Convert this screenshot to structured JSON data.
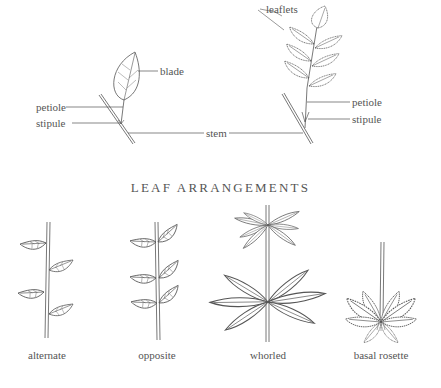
{
  "anatomy": {
    "simple_leaf": {
      "labels": {
        "blade": "blade",
        "petiole": "petiole",
        "stipule": "stipule"
      }
    },
    "compound_leaf": {
      "labels": {
        "leaflets": "leaflets",
        "petiole": "petiole",
        "stipule": "stipule"
      }
    },
    "shared_label": {
      "stem": "stem"
    }
  },
  "section_title": "LEAF ARRANGEMENTS",
  "arrangements": [
    {
      "id": "alternate",
      "caption": "alternate"
    },
    {
      "id": "opposite",
      "caption": "opposite"
    },
    {
      "id": "whorled",
      "caption": "whorled"
    },
    {
      "id": "basal-rosette",
      "caption": "basal rosette"
    }
  ],
  "colors": {
    "line": "#555555",
    "background": "#ffffff"
  }
}
